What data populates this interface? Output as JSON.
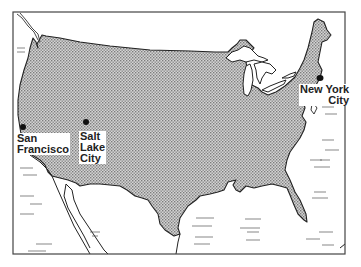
{
  "map": {
    "title": "United States cities map",
    "colors": {
      "land_pattern_dark": "#7a7a7a",
      "land_pattern_light": "#d9d9d9",
      "outline": "#222222",
      "frame": "#444444",
      "water": "#ffffff"
    },
    "cities": [
      {
        "name": "San Francisco",
        "line1": "San",
        "line2": "Francisco",
        "icon": "city-dot-icon"
      },
      {
        "name": "Salt Lake City",
        "line1": "Salt",
        "line2": "Lake",
        "line3": "City",
        "icon": "city-dot-icon"
      },
      {
        "name": "New York City",
        "line1": "New York",
        "line2": "City",
        "icon": "city-dot-icon"
      }
    ]
  }
}
